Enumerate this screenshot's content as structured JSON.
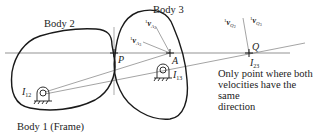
{
  "diagram": {
    "bodies": [
      {
        "id": "body2",
        "label": "Body 2"
      },
      {
        "id": "body3",
        "label": "Body 3"
      },
      {
        "id": "body1",
        "label": "Body 1 (Frame)"
      }
    ],
    "points": {
      "P": "P",
      "A": "A",
      "Q": "Q",
      "I12": {
        "main": "I",
        "sub": "12"
      },
      "I13": {
        "main": "I",
        "sub": "13"
      },
      "I23": {
        "main": "I",
        "sub": "23"
      }
    },
    "velocities": {
      "vA2": {
        "sup": "1",
        "main": "v",
        "sub": "A",
        "subsub": "2"
      },
      "vA3": {
        "sup": "1",
        "main": "v",
        "sub": "A",
        "subsub": "3"
      },
      "vQ2": {
        "sup": "1",
        "main": "v",
        "sub": "Q",
        "subsub": "2"
      },
      "vQ3": {
        "sup": "1",
        "main": "v",
        "sub": "Q",
        "subsub": "3"
      }
    },
    "annotation": {
      "line1": "Only point where both",
      "line2": "velocities have the same",
      "line3": "direction"
    },
    "colors": {
      "stroke": "#1a1a1a",
      "thin": "#555555"
    }
  }
}
